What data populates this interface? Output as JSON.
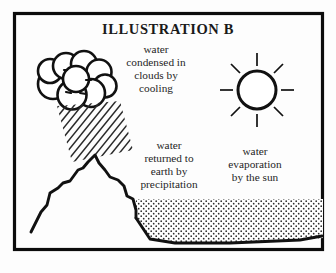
{
  "figure": {
    "title": "ILLUSTRATION B",
    "border_color": "#0c0c0c",
    "background_color": "#fdfdfd",
    "ink_color": "#111111"
  },
  "labels": {
    "cloud_caption": {
      "name": "water-condensed-caption",
      "lines": [
        "water",
        "condensed in",
        "clouds by",
        "cooling"
      ]
    },
    "precipitation_caption": {
      "name": "water-returned-caption",
      "lines": [
        "water",
        "returned to",
        "earth by",
        "precipitation"
      ]
    },
    "evaporation_caption": {
      "name": "water-evaporation-caption",
      "lines": [
        "water",
        "evaporation",
        "by the sun"
      ]
    }
  },
  "graphics": {
    "cloud": {
      "name": "rain-cloud",
      "puff_count": 9
    },
    "rain": {
      "name": "rain-hatching",
      "line_count": 19,
      "angle_degrees": 45
    },
    "sun": {
      "name": "sun",
      "ray_count": 8,
      "center_x": 257,
      "center_y": 90,
      "radius": 19
    },
    "mountain": {
      "name": "mountain-range"
    },
    "water_body": {
      "name": "body-of-water",
      "fill_pattern": "stipple-dots"
    }
  }
}
